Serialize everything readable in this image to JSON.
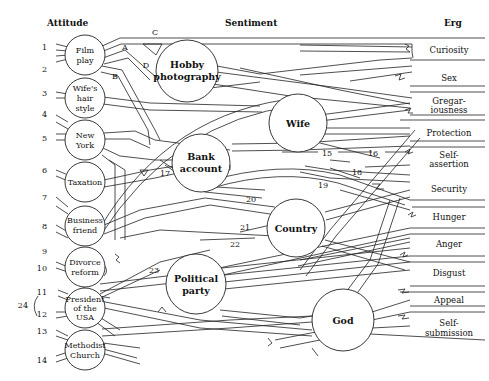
{
  "headers": {
    "attitude": "Attitude",
    "sentiment": "Sentiment",
    "erg": "Erg"
  },
  "attitudes": [
    {
      "id": "film",
      "lines": [
        "Film",
        "play"
      ],
      "inputs": [
        "1",
        "2"
      ]
    },
    {
      "id": "wifes-hair",
      "lines": [
        "Wife's",
        "hair",
        "style"
      ],
      "inputs": [
        "3"
      ]
    },
    {
      "id": "new-york",
      "lines": [
        "New",
        "York"
      ],
      "inputs": [
        "4",
        "5"
      ]
    },
    {
      "id": "taxation",
      "lines": [
        "Taxation"
      ],
      "inputs": [
        "6"
      ]
    },
    {
      "id": "business-friend",
      "lines": [
        "Business",
        "friend"
      ],
      "inputs": [
        "7",
        "8"
      ]
    },
    {
      "id": "divorce-reform",
      "lines": [
        "Divorce",
        "reform"
      ],
      "inputs": [
        "9",
        "10"
      ]
    },
    {
      "id": "president",
      "lines": [
        "President",
        "of the",
        "USA"
      ],
      "inputs": [
        "11",
        "12"
      ]
    },
    {
      "id": "methodist",
      "lines": [
        "Methodist",
        "Church"
      ],
      "inputs": [
        "13",
        "14"
      ]
    }
  ],
  "input_numbers": [
    "1",
    "2",
    "3",
    "4",
    "5",
    "6",
    "7",
    "8",
    "9",
    "10",
    "11",
    "12",
    "13",
    "14"
  ],
  "bracket_label": "24",
  "sentiments": [
    {
      "id": "hobby",
      "lines": [
        "Hobby",
        "photography"
      ]
    },
    {
      "id": "wife",
      "lines": [
        "Wife"
      ]
    },
    {
      "id": "bank",
      "lines": [
        "Bank",
        "account"
      ]
    },
    {
      "id": "country",
      "lines": [
        "Country"
      ]
    },
    {
      "id": "political",
      "lines": [
        "Political",
        "party"
      ]
    },
    {
      "id": "god",
      "lines": [
        "God"
      ]
    }
  ],
  "ergs": [
    {
      "lines": [
        "Curiosity"
      ]
    },
    {
      "lines": [
        "Sex"
      ]
    },
    {
      "lines": [
        "Gregar-",
        "iousness"
      ]
    },
    {
      "lines": [
        "Protection"
      ]
    },
    {
      "lines": [
        "Self-",
        "assertion"
      ]
    },
    {
      "lines": [
        "Security"
      ]
    },
    {
      "lines": [
        "Hunger"
      ]
    },
    {
      "lines": [
        "Anger"
      ]
    },
    {
      "lines": [
        "Disgust"
      ]
    },
    {
      "lines": [
        "Appeal"
      ]
    },
    {
      "lines": [
        "Self-",
        "submission"
      ]
    }
  ],
  "path_letters": [
    "A",
    "B",
    "C",
    "D"
  ],
  "path_numbers": [
    "15",
    "16",
    "17",
    "18",
    "19",
    "20",
    "21",
    "22",
    "23"
  ]
}
